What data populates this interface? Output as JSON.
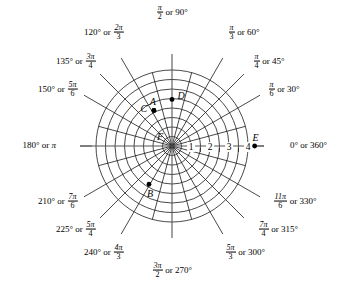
{
  "figure": {
    "type": "polar-coordinate-grid",
    "title": "",
    "center_px": [
      172,
      146
    ],
    "unit_px": 19.0,
    "background": "#ffffff",
    "line_color": "#1a1a1a",
    "axis_color": "#555555"
  },
  "chart_data": {
    "type": "scatter",
    "coordinate_system": "polar",
    "title": "",
    "xlabel": "",
    "ylabel": "",
    "rlim": [
      0,
      4
    ],
    "radial_ticks": [
      1,
      2,
      3,
      4
    ],
    "radial_tick_labels": [
      "1",
      "2",
      "3",
      "4"
    ],
    "minor_radial_rings": [
      0.5,
      1.5,
      2.5,
      3.5
    ],
    "grid": true,
    "legend": "none",
    "angular_step_deg": 15,
    "points": [
      {
        "name": "A",
        "r": 2.1,
        "theta_deg": 117,
        "label_dx": -1,
        "label_dy": -9
      },
      {
        "name": "C",
        "r": 2.1,
        "theta_deg": 117,
        "label_dx": -10,
        "label_dy": -2
      },
      {
        "name": "D",
        "r": 2.45,
        "theta_deg": 90,
        "label_dx": 9,
        "label_dy": -4
      },
      {
        "name": "E",
        "r": 4.35,
        "theta_deg": 0,
        "label_dx": 1,
        "label_dy": -9
      },
      {
        "name": "F",
        "r": 0.0,
        "theta_deg": 0,
        "label_dx": -12,
        "label_dy": -10
      },
      {
        "name": "B",
        "r": 2.35,
        "theta_deg": 239,
        "label_dx": 1,
        "label_dy": 9
      }
    ]
  },
  "angle_labels": [
    {
      "id": "ang-90",
      "deg_text": "90°",
      "rad_num": "π",
      "rad_den": "2",
      "order": "rad-first",
      "joiner": " or ",
      "anchor": "center",
      "x": 172,
      "y": 13
    },
    {
      "id": "ang-60",
      "deg_text": "60°",
      "rad_num": "π",
      "rad_den": "3",
      "order": "rad-first",
      "joiner": " or ",
      "anchor": "left",
      "x": 228,
      "y": 33
    },
    {
      "id": "ang-45",
      "deg_text": "45°",
      "rad_num": "π",
      "rad_den": "4",
      "order": "rad-first",
      "joiner": " or ",
      "anchor": "left",
      "x": 253,
      "y": 62
    },
    {
      "id": "ang-30",
      "deg_text": "30°",
      "rad_num": "π",
      "rad_den": "6",
      "order": "rad-first",
      "joiner": " or ",
      "anchor": "left",
      "x": 268,
      "y": 90
    },
    {
      "id": "ang-0-360",
      "deg_text": "0° or 360°",
      "rad_num": "",
      "rad_den": "",
      "order": "deg-only",
      "joiner": "",
      "anchor": "left",
      "x": 290,
      "y": 146
    },
    {
      "id": "ang-330",
      "deg_text": "330°",
      "rad_num": "11π",
      "rad_den": "6",
      "order": "rad-first",
      "joiner": " or ",
      "anchor": "left",
      "x": 273,
      "y": 202
    },
    {
      "id": "ang-315",
      "deg_text": "315°",
      "rad_num": "7π",
      "rad_den": "4",
      "order": "rad-first",
      "joiner": " or ",
      "anchor": "left",
      "x": 258,
      "y": 230
    },
    {
      "id": "ang-300",
      "deg_text": "300°",
      "rad_num": "5π",
      "rad_den": "3",
      "order": "rad-first",
      "joiner": " or ",
      "anchor": "left",
      "x": 225,
      "y": 253
    },
    {
      "id": "ang-270",
      "deg_text": "270°",
      "rad_num": "3π",
      "rad_den": "2",
      "order": "rad-first",
      "joiner": " or ",
      "anchor": "center",
      "x": 172,
      "y": 271
    },
    {
      "id": "ang-240",
      "deg_text": "240°",
      "rad_num": "4π",
      "rad_den": "3",
      "order": "deg-first",
      "joiner": " or ",
      "anchor": "right",
      "x": 124,
      "y": 253
    },
    {
      "id": "ang-225",
      "deg_text": "225°",
      "rad_num": "5π",
      "rad_den": "4",
      "order": "deg-first",
      "joiner": " or ",
      "anchor": "right",
      "x": 96,
      "y": 230
    },
    {
      "id": "ang-210",
      "deg_text": "210°",
      "rad_num": "7π",
      "rad_den": "6",
      "order": "deg-first",
      "joiner": " or ",
      "anchor": "right",
      "x": 78,
      "y": 202
    },
    {
      "id": "ang-180",
      "deg_text": "180°",
      "rad_num": "π",
      "rad_den": "",
      "order": "deg-then-pi",
      "joiner": " or ",
      "anchor": "right",
      "x": 56,
      "y": 146
    },
    {
      "id": "ang-150",
      "deg_text": "150°",
      "rad_num": "5π",
      "rad_den": "6",
      "order": "deg-first",
      "joiner": " or ",
      "anchor": "right",
      "x": 78,
      "y": 90
    },
    {
      "id": "ang-135",
      "deg_text": "135°",
      "rad_num": "3π",
      "rad_den": "4",
      "order": "deg-first",
      "joiner": " or ",
      "anchor": "right",
      "x": 96,
      "y": 62
    },
    {
      "id": "ang-120",
      "deg_text": "120°",
      "rad_num": "2π",
      "rad_den": "3",
      "order": "deg-first",
      "joiner": " or ",
      "anchor": "right",
      "x": 124,
      "y": 33
    }
  ]
}
